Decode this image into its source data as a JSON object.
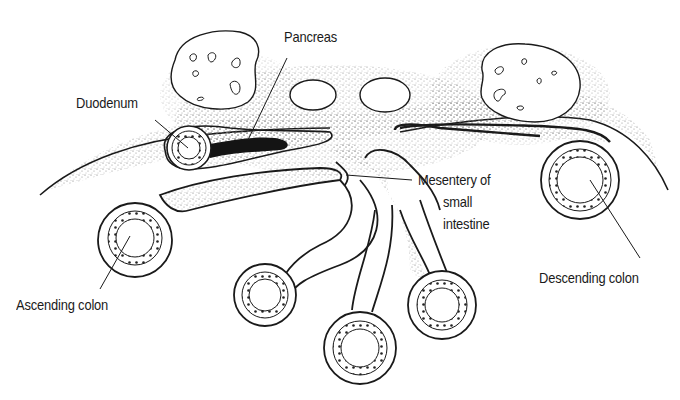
{
  "figure": {
    "type": "anatomical cross-section illustration",
    "colors": {
      "ink": "#1a1a1a",
      "stipple": "#8a8a8a",
      "background": "#ffffff"
    }
  },
  "labels": {
    "pancreas": "Pancreas",
    "duodenum": "Duodenum",
    "mesentery_line1": "Mesentery of",
    "mesentery_line2": "small",
    "mesentery_line3": "intestine",
    "ascending_colon": "Ascending colon",
    "descending_colon": "Descending colon"
  },
  "structures": [
    "left-kidney",
    "right-kidney",
    "aorta",
    "inferior-vena-cava",
    "duodenum",
    "pancreas",
    "ascending-colon",
    "descending-colon",
    "small-intestine-loop-1",
    "small-intestine-loop-2",
    "small-intestine-loop-3",
    "small-intestine-loop-4",
    "mesentery",
    "posterior-abdominal-wall"
  ]
}
